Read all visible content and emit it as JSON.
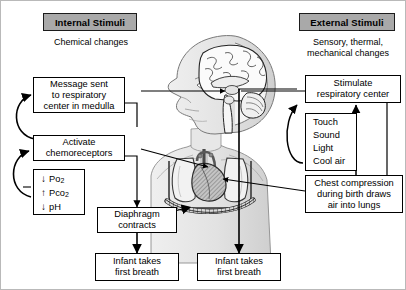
{
  "figure": {
    "type": "physiology-flow-diagram"
  },
  "left_column": {
    "banner": "Internal Stimuli",
    "caption": "Chemical changes",
    "boxes": [
      {
        "id": "message-medulla",
        "lines": [
          "Message sent",
          "to respiratory",
          "center in medulla"
        ]
      },
      {
        "id": "activate-chemoreceptors",
        "lines": [
          "Activate",
          "chemoreceptors"
        ]
      },
      {
        "id": "diaphragm-contracts",
        "lines": [
          "Diaphragm",
          "contracts"
        ]
      },
      {
        "id": "infant-first-breath-left",
        "lines": [
          "Infant takes",
          "first breath"
        ]
      }
    ],
    "gas_changes": [
      {
        "arrow": "down",
        "label": "Po",
        "sub": "2"
      },
      {
        "arrow": "up",
        "label": "Pco",
        "sub": "2"
      },
      {
        "arrow": "down",
        "label": "pH",
        "sub": ""
      }
    ]
  },
  "right_column": {
    "banner": "External Stimuli",
    "caption_lines": [
      "Sensory, thermal,",
      "mechanical changes"
    ],
    "boxes": [
      {
        "id": "stimulate-respiratory-center",
        "lines": [
          "Stimulate",
          "respiratory center"
        ]
      },
      {
        "id": "sensory-stimuli-list",
        "lines": [
          "Touch",
          "Sound",
          "Light",
          "Cool air"
        ]
      },
      {
        "id": "chest-compression",
        "lines": [
          "Chest compression",
          "during birth draws",
          "air into lungs"
        ]
      },
      {
        "id": "infant-first-breath-right",
        "lines": [
          "Infant takes",
          "first breath"
        ]
      }
    ]
  },
  "illustration": {
    "name": "newborn-infant-sagittal-head-and-thorax",
    "parts": [
      "brain-sagittal-section",
      "medulla-oblongata",
      "infant-head-profile",
      "thorax",
      "lungs",
      "heart",
      "aorta-chemoreceptors",
      "diaphragm",
      "rib-cage"
    ]
  },
  "colors": {
    "banner_fill": "#a9a9a9",
    "box_border": "#000000",
    "arrow": "#000000",
    "page_bg": "#ffffff",
    "anatomy_light": "#e6e6e6",
    "anatomy_mid": "#c9c9c9",
    "anatomy_dark": "#8f8f8f"
  }
}
